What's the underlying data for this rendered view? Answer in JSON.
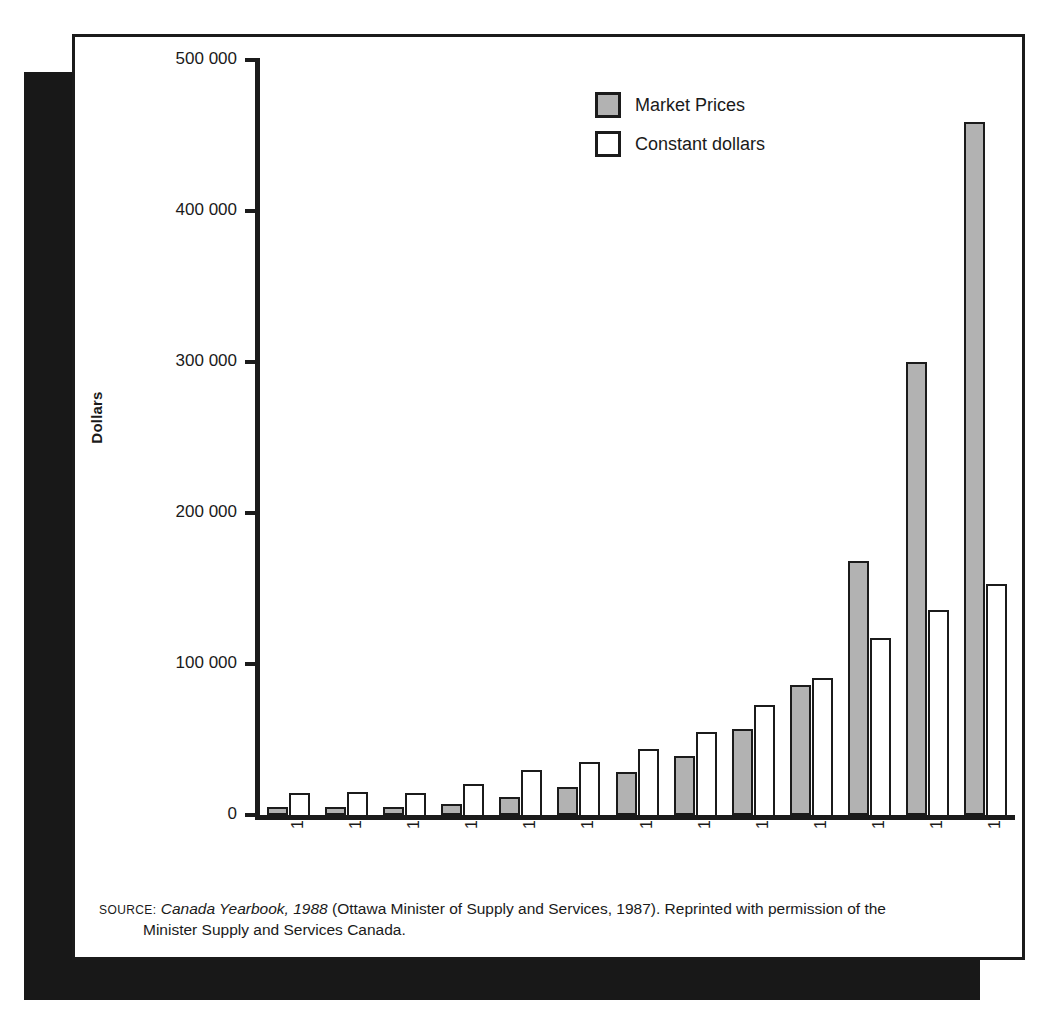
{
  "chart_data": {
    "type": "bar",
    "title": "",
    "xlabel": "",
    "ylabel": "Dollars",
    "ylim": [
      0,
      500000
    ],
    "yticks": [
      0,
      100000,
      200000,
      300000,
      400000,
      500000
    ],
    "ytick_labels": [
      "0",
      "100 000",
      "200 000",
      "300 000",
      "400 000",
      "500 000"
    ],
    "grid": false,
    "legend_position": "top-center-right",
    "categories": [
      "1926",
      "1930",
      "1935",
      "1940",
      "1945",
      "1950",
      "1955",
      "1960",
      "1965",
      "1970",
      "1975",
      "1980",
      "1985"
    ],
    "series": [
      {
        "name": "Market Prices",
        "color": "#b2b2b2",
        "values": [
          5500,
          5500,
          5000,
          7000,
          12000,
          18500,
          28500,
          39000,
          57000,
          86000,
          168000,
          300000,
          459000
        ]
      },
      {
        "name": "Constant dollars",
        "color": "#ffffff",
        "values": [
          14500,
          15500,
          14500,
          20500,
          30000,
          35000,
          43500,
          55000,
          73000,
          91000,
          117000,
          136000,
          153000
        ]
      }
    ]
  },
  "legend": {
    "items": [
      {
        "label": "Market Prices",
        "swatch": "market"
      },
      {
        "label": "Constant dollars",
        "swatch": "constant"
      }
    ]
  },
  "source": {
    "label": "SOURCE:",
    "title_italic": "Canada Yearbook, 1988",
    "rest_line1": "(Ottawa Minister of Supply and Services, 1987). Reprinted with permission of the",
    "line2": "Minister Supply and Services Canada."
  }
}
